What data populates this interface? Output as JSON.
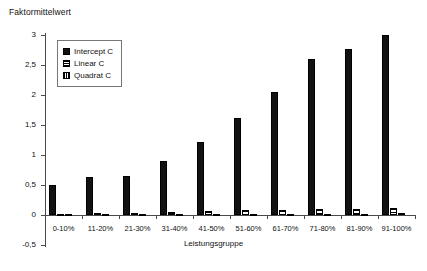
{
  "chart_data": {
    "type": "bar",
    "title": "",
    "ylabel": "Faktormittelwert",
    "xlabel": "Leistungsgruppe",
    "ylim": [
      -0.5,
      3
    ],
    "ytick_labels": [
      "3",
      "2,5",
      "2",
      "1,5",
      "1",
      "0,5",
      "0",
      "-0,5"
    ],
    "ytick_values": [
      3,
      2.5,
      2,
      1.5,
      1,
      0.5,
      0,
      -0.5
    ],
    "grid": false,
    "legend_position": "upper-left-inside",
    "categories": [
      "0-10%",
      "11-20%",
      "21-30%",
      "31-40%",
      "41-50%",
      "51-60%",
      "61-70%",
      "71-80%",
      "81-90%",
      "91-100%"
    ],
    "series": [
      {
        "name": "Intercept C",
        "fill": "solid-black",
        "color": "#121212",
        "values": [
          0.5,
          0.63,
          0.65,
          0.9,
          1.22,
          1.62,
          2.05,
          2.6,
          2.77,
          3.0
        ]
      },
      {
        "name": "Linear C",
        "fill": "horizontal-stripes",
        "color": "#000000",
        "values": [
          0.02,
          0.03,
          0.04,
          0.05,
          0.06,
          0.08,
          0.09,
          0.1,
          0.1,
          0.12
        ]
      },
      {
        "name": "Quadrat C",
        "fill": "vertical-stripes",
        "color": "#000000",
        "values": [
          0.01,
          0.01,
          0.01,
          0.01,
          0.02,
          0.02,
          0.02,
          0.02,
          0.02,
          0.03
        ]
      }
    ]
  },
  "legend": {
    "items": [
      {
        "label": "Intercept C",
        "swatch": "solid-square-icon"
      },
      {
        "label": "Linear C",
        "swatch": "horizontal-stripe-square-icon"
      },
      {
        "label": "Quadrat C",
        "swatch": "vertical-stripe-square-icon"
      }
    ]
  }
}
